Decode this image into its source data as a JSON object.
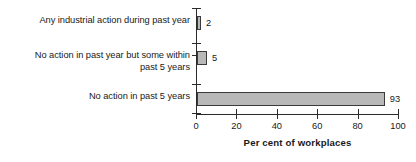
{
  "chart_data": {
    "type": "bar",
    "orientation": "horizontal",
    "title": "",
    "xlabel": "Per cent of workplaces",
    "ylabel": "",
    "xlim": [
      0,
      100
    ],
    "xticks": [
      0,
      20,
      40,
      60,
      80,
      100
    ],
    "xtick_labels": [
      "0",
      "20",
      "40",
      "60",
      "80",
      "100"
    ],
    "grid": false,
    "legend": false,
    "categories": [
      "Any industrial action during past year",
      "No action in past year but some within\npast 5 years",
      "No action in past 5 years"
    ],
    "values": [
      2,
      5,
      93
    ],
    "data_labels": [
      "2",
      "5",
      "93"
    ],
    "colors": {
      "bar_fill": "#b8b8b8",
      "bar_border": "#3a3a3a",
      "axis": "#2a2a2a",
      "text": "#1a1a1a",
      "background": "#ffffff"
    }
  }
}
